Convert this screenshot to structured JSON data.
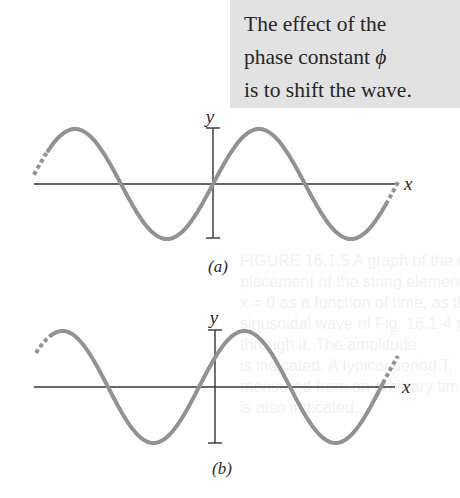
{
  "callout": {
    "lines": [
      "The effect of the",
      "phase constant ",
      "is to shift the wave."
    ],
    "symbol": "ϕ",
    "background": "#e2e2e2"
  },
  "ghost_text": {
    "lines": [
      "FIGURE 16.1.5  A graph of the dis-",
      "placement of the string element at",
      "x = 0 as a function of time, as the",
      "sinusoidal wave of Fig. 16.1-4 passes",
      "through it. The amplitude",
      "is indicated. A typical period T,",
      "measured from an arbitrary time t1,",
      "is also indicated."
    ]
  },
  "figures": [
    {
      "id": "a",
      "caption": "(a)",
      "x_label": "x",
      "y_label": "y",
      "wave_color": "#929292",
      "axis_color": "#333333",
      "axis_y": 184,
      "x_axis_start": 34,
      "x_axis_end": 398,
      "y_axis_x": 213,
      "y_axis_top": 128,
      "y_axis_bottom": 238,
      "amplitude": 55,
      "period": 184,
      "phase_zero_x": 213,
      "solid_from": 48,
      "solid_to": 386,
      "dash_left_from": 34,
      "dash_right_to": 398
    },
    {
      "id": "b",
      "caption": "(b)",
      "x_label": "x",
      "y_label": "y",
      "wave_color": "#929292",
      "axis_color": "#333333",
      "axis_y": 387,
      "x_axis_start": 34,
      "x_axis_end": 395,
      "y_axis_x": 215,
      "y_axis_top": 330,
      "y_axis_bottom": 443,
      "amplitude": 56,
      "period": 182,
      "phase_zero_x": 199,
      "solid_from": 52,
      "solid_to": 383,
      "dash_left_from": 36,
      "dash_right_to": 398
    }
  ]
}
